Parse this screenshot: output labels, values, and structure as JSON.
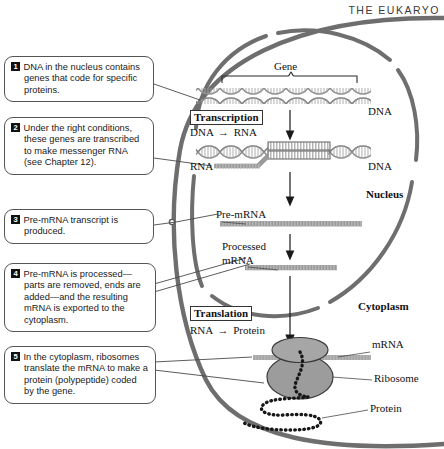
{
  "page": {
    "running_head": "THE EUKARYO",
    "figure_topic": "Gene expression in a eukaryotic cell"
  },
  "callouts": [
    {
      "number": "1",
      "text": "DNA in the nucleus contains genes that code for specific proteins."
    },
    {
      "number": "2",
      "text": "Under the right conditions, these genes are transcribed to make messenger RNA (see Chapter 12)."
    },
    {
      "number": "3",
      "text": "Pre-mRNA transcript is produced."
    },
    {
      "number": "4",
      "text": "Pre-mRNA is processed—parts are removed, ends are added—and the resulting mRNA is exported to the cytoplasm."
    },
    {
      "number": "5",
      "text": "In the cytoplasm, ribosomes translate the mRNA to make a protein (polypeptide) coded by the gene."
    }
  ],
  "diagram": {
    "gene_bracket_label": "Gene",
    "dna_label_top": "DNA",
    "dna_label_bottom": "DNA",
    "rna_label": "RNA",
    "pre_mrna_label": "Pre-mRNA",
    "processed_mrna_label_line1": "Processed",
    "processed_mrna_label_line2": "mRNA",
    "nucleus_label": "Nucleus",
    "cytoplasm_label": "Cytoplasm",
    "mrna_label": "mRNA",
    "ribosome_label": "Ribosome",
    "protein_label": "Protein",
    "transcription": {
      "title": "Transcription",
      "reactant": "DNA",
      "arrow": "→",
      "product": "RNA"
    },
    "translation": {
      "title": "Translation",
      "reactant": "RNA",
      "arrow": "→",
      "product": "Protein"
    }
  },
  "colors": {
    "membrane": "#6e6e6e",
    "strand": "#9a9a9a",
    "ribosome": "#9c9c9c",
    "text": "#121212",
    "badge_bg": "#111111",
    "callout_border": "#555555"
  }
}
